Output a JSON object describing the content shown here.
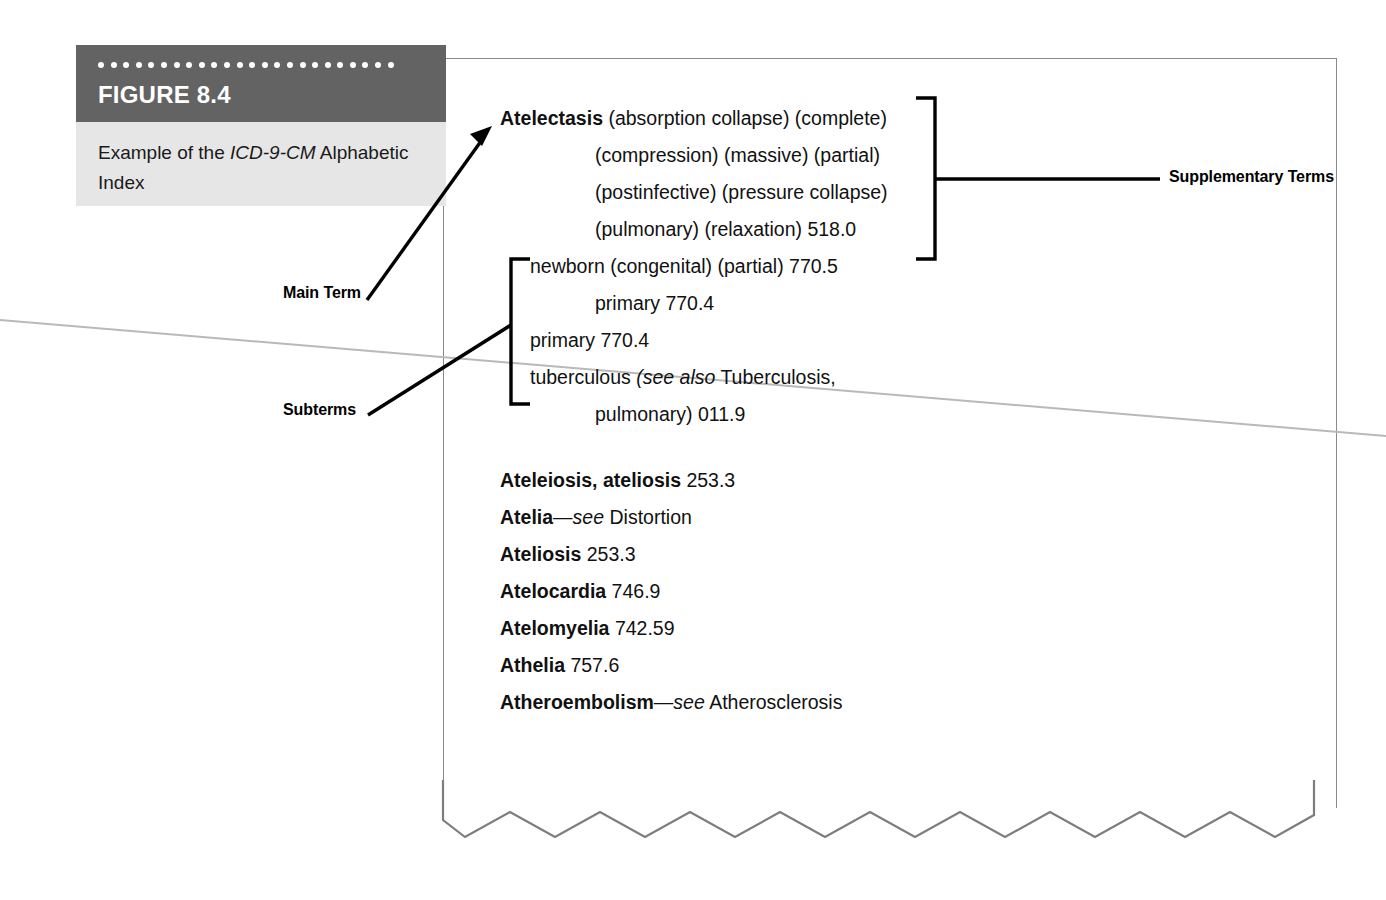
{
  "figure": {
    "number_label": "FIGURE 8.4",
    "caption_prefix": "Example of the ",
    "caption_italic": "ICD-9-CM",
    "caption_suffix": " Alphabetic Index",
    "band_color": "#636363",
    "panel_color": "#e6e6e6",
    "dot_count": 24
  },
  "index_entry": {
    "main_term": "Atelectasis",
    "main_term_rest": " (absorption collapse) (complete)",
    "continuation_lines": [
      "(compression) (massive) (partial)",
      "(postinfective) (pressure collapse)",
      "(pulmonary) (relaxation) 518.0"
    ],
    "subterms": [
      {
        "text": "newborn (congenital) (partial) 770.5",
        "indent": "sub"
      },
      {
        "text": "primary 770.4",
        "indent": "sub2"
      },
      {
        "text": "primary 770.4",
        "indent": "sub"
      },
      {
        "text": "tuberculous ",
        "italic": "(see also",
        "italic2": " Tuberculosis,",
        "indent": "sub"
      },
      {
        "text": "pulmonary) 011.9",
        "indent": "sub2"
      }
    ]
  },
  "entries": [
    {
      "term": "Ateleiosis, ateliosis",
      "code": " 253.3"
    },
    {
      "term": "Atelia",
      "dash": "—",
      "italic": "see",
      "ref": " Distortion"
    },
    {
      "term": "Ateliosis",
      "code": " 253.3"
    },
    {
      "term": "Atelocardia",
      "code": " 746.9"
    },
    {
      "term": "Atelomyelia",
      "code": " 742.59"
    },
    {
      "term": "Athelia",
      "code": " 757.6"
    },
    {
      "term": "Atheroembolism",
      "dash": "—",
      "italic": "see",
      "ref": " Atherosclerosis"
    }
  ],
  "callouts": {
    "main_term": "Main Term",
    "subterms": "Subterms",
    "supplementary_terms": "Supplementary Terms"
  },
  "colors": {
    "page_border": "#8a8a8a",
    "torn_edge": "#7d7d7d",
    "crease": "#b9b9b9",
    "annotation": "#000000"
  }
}
